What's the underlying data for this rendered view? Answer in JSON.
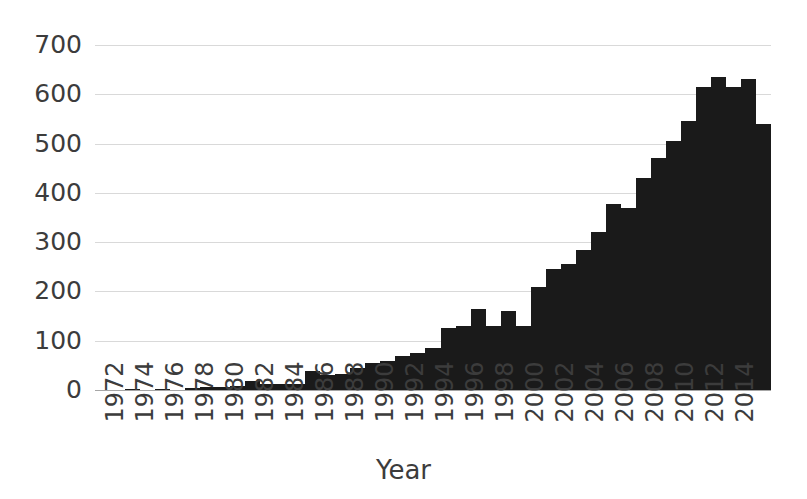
{
  "chart_data": {
    "type": "bar",
    "title": "",
    "subtitle": "",
    "xlabel": "Year",
    "ylabel": "",
    "ylim": [
      0,
      700
    ],
    "ytick_step": 100,
    "yticks": [
      700,
      600,
      500,
      400,
      300,
      200,
      100,
      0
    ],
    "ytick_labels": [
      "700",
      "600",
      "500",
      "400",
      "300",
      "200",
      "100",
      "0"
    ],
    "grid": true,
    "grid_axis": "y",
    "legend": false,
    "legend_position": "none",
    "bar_color": "#1a1a1a",
    "grid_color": "#d9d9d9",
    "axis_color": "#a6a6a6",
    "text_color": "#3c3c3c",
    "xtick_labels": [
      "1972",
      "1974",
      "1976",
      "1978",
      "1980",
      "1982",
      "1984",
      "1986",
      "1988",
      "1990",
      "1992",
      "1994",
      "1996",
      "1998",
      "2000",
      "2002",
      "2004",
      "2006",
      "2008",
      "2010",
      "2012",
      "2014"
    ],
    "xtick_label_rotation": -90,
    "x_range": [
      1972,
      2016
    ],
    "categories": [
      1972,
      1973,
      1974,
      1975,
      1976,
      1977,
      1978,
      1979,
      1980,
      1981,
      1982,
      1983,
      1984,
      1985,
      1986,
      1987,
      1988,
      1989,
      1990,
      1991,
      1992,
      1993,
      1994,
      1995,
      1996,
      1997,
      1998,
      1999,
      2000,
      2001,
      2002,
      2003,
      2004,
      2005,
      2006,
      2007,
      2008,
      2009,
      2010,
      2011,
      2012,
      2013,
      2014,
      2015,
      2016
    ],
    "values": [
      0,
      0,
      3,
      0,
      2,
      0,
      5,
      6,
      7,
      8,
      18,
      12,
      12,
      12,
      38,
      30,
      32,
      45,
      55,
      58,
      70,
      75,
      85,
      125,
      130,
      165,
      130,
      160,
      130,
      210,
      245,
      255,
      285,
      320,
      378,
      370,
      430,
      470,
      505,
      545,
      615,
      635,
      615,
      632,
      540
    ]
  }
}
